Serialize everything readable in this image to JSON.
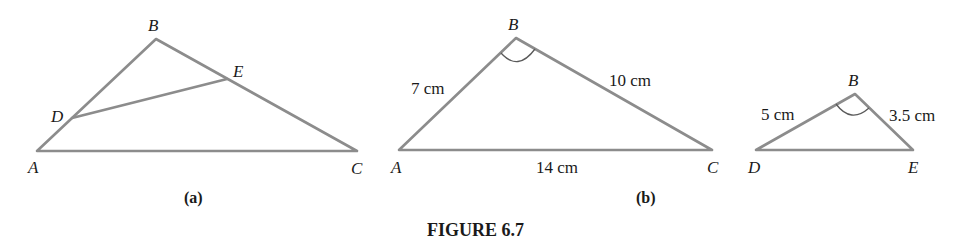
{
  "caption": "FIGURE 6.7",
  "line_color": "#8c8c8c",
  "figures": [
    {
      "sublabel": "(a)",
      "vertices": {
        "A": "A",
        "B": "B",
        "C": "C",
        "D": "D",
        "E": "E"
      },
      "measures": {}
    },
    {
      "sublabel": "(b)",
      "vertices": {
        "A": "A",
        "B": "B",
        "C": "C"
      },
      "measures": {
        "AB": "7 cm",
        "BC": "10 cm",
        "AC": "14 cm"
      }
    },
    {
      "sublabel": "",
      "vertices": {
        "D": "D",
        "B": "B",
        "E": "E"
      },
      "measures": {
        "DB": "5 cm",
        "BE": "3.5 cm"
      }
    }
  ]
}
